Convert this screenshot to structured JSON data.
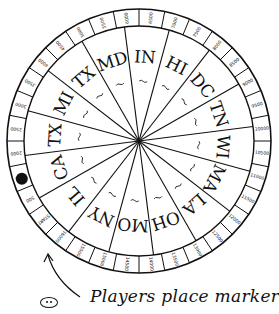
{
  "diagram": {
    "type": "game-board-wheel",
    "center": [
      139,
      141
    ],
    "outer_radius": 132,
    "rim_inner_radius": 115,
    "sectors": [
      {
        "label": "IN"
      },
      {
        "label": "HI"
      },
      {
        "label": "DC"
      },
      {
        "label": "TN"
      },
      {
        "label": "WI"
      },
      {
        "label": "MA"
      },
      {
        "label": "LA"
      },
      {
        "label": "OH"
      },
      {
        "label": "MO"
      },
      {
        "label": "NY"
      },
      {
        "label": "IL"
      },
      {
        "label": "CA"
      },
      {
        "label": "TX"
      },
      {
        "label": "MI"
      },
      {
        "label": "TX"
      },
      {
        "label": "MD"
      }
    ],
    "rim_values": [
      "START",
      "500",
      "1000",
      "2000",
      "2500",
      "3000",
      "3500",
      "4000",
      "4500",
      "5000",
      "5500",
      "6000",
      "6500",
      "7000",
      "7500",
      "8000",
      "8500",
      "9000",
      "9500",
      "10000",
      "10500",
      "11000",
      "11500",
      "12000",
      "12500",
      "13000",
      "13500",
      "14000",
      "14500",
      "15000",
      "15500",
      "16000"
    ],
    "marker": {
      "position_label": "1000",
      "color": "#111111"
    },
    "caption": "Players place markers",
    "colors": {
      "ink": "#111111",
      "paper": "#ffffff"
    }
  }
}
